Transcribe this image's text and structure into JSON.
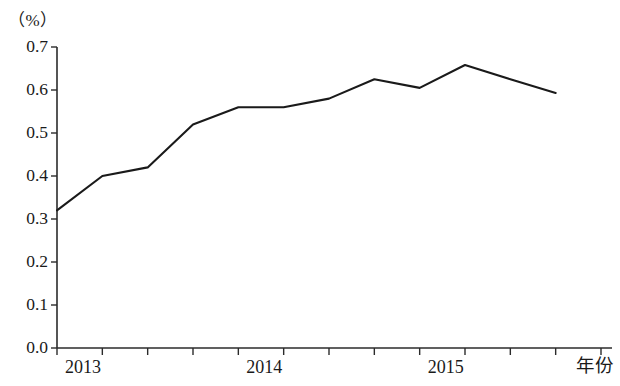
{
  "chart_data": {
    "type": "line",
    "title": "",
    "subtitle": "",
    "xlabel": "年份",
    "ylabel": "（%）",
    "unit_label": "（%）",
    "ylim": [
      0.0,
      0.7
    ],
    "ytick_labels": [
      "0.0",
      "0.1",
      "0.2",
      "0.3",
      "0.4",
      "0.5",
      "0.6",
      "0.7"
    ],
    "ytick_values": [
      0.0,
      0.1,
      0.2,
      0.3,
      0.4,
      0.5,
      0.6,
      0.7
    ],
    "xtick_labels": [
      "2013",
      "2014",
      "2015"
    ],
    "xtick_positions": [
      0,
      4,
      8
    ],
    "x_axis_end_label": "年份",
    "grid": false,
    "legend": null,
    "legend_position": "none",
    "markers": false,
    "line_color": "#1a1a1a",
    "axis_color": "#2b2b2b",
    "background_color": "#ffffff",
    "x": [
      0,
      1,
      2,
      3,
      4,
      5,
      6,
      7,
      8,
      9,
      10,
      11
    ],
    "categories": [
      "2013 Q1",
      "2013 Q2",
      "2013 Q3",
      "2013 Q4",
      "2014 Q1",
      "2014 Q2",
      "2014 Q3",
      "2014 Q4",
      "2015 Q1",
      "2015 Q2",
      "2015 Q3",
      "2015 Q4"
    ],
    "values": [
      0.32,
      0.4,
      0.42,
      0.52,
      0.56,
      0.56,
      0.58,
      0.625,
      0.605,
      0.658,
      0.625,
      0.593
    ],
    "n_minor_ticks": 12,
    "annotations": []
  }
}
